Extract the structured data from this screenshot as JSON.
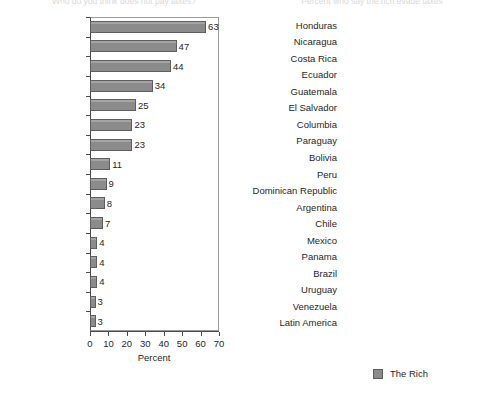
{
  "page": {
    "cut_off_title_left": "Who do you think does not pay taxes?",
    "cut_off_title_right": "Percent who say the rich evade taxes"
  },
  "legend": {
    "label": "The Rich",
    "swatch_color": "#8b8b8b"
  },
  "chart_data": [
    {
      "type": "bar",
      "orientation": "horizontal",
      "title": "",
      "xlabel": "Percent",
      "ylabel": "",
      "xlim": [
        0,
        70
      ],
      "xticks": [
        0,
        10,
        20,
        30,
        40,
        50,
        60,
        70
      ],
      "grid": false,
      "legend_position": "none",
      "series_name": "The Rich",
      "bar_color": "#8b8b8b",
      "categories": [
        "Rich",
        "Politicians",
        "Millionaires",
        "Public officials",
        "Congressmen",
        "Authorities",
        "Companies",
        "The media",
        "Poor",
        "Middle class",
        "Priests",
        "Don't know",
        "Students",
        "Retired",
        "Employees",
        "Women"
      ],
      "values": [
        63,
        47,
        44,
        34,
        25,
        23,
        23,
        11,
        9,
        8,
        7,
        4,
        4,
        4,
        3,
        3
      ]
    },
    {
      "type": "bar",
      "orientation": "horizontal",
      "title": "",
      "xlabel": "Percent",
      "ylabel": "",
      "xlim": [
        0,
        90
      ],
      "xticks": [
        0,
        10,
        20,
        30,
        40,
        50,
        60,
        70,
        80,
        90
      ],
      "grid": false,
      "legend_position": "bottom",
      "series_name": "The Rich",
      "bar_color": "#8b8b8b",
      "categories": [
        "Honduras",
        "Nicaragua",
        "Costa Rica",
        "Ecuador",
        "Guatemala",
        "El Salvador",
        "Columbia",
        "Paraguay",
        "Bolivia",
        "Peru",
        "Dominican Republic",
        "Argentina",
        "Chile",
        "Mexico",
        "Panama",
        "Brazil",
        "Uruguay",
        "Venezuela",
        "Latin America"
      ],
      "values": [
        76,
        73,
        72,
        69,
        67,
        66,
        65,
        64,
        64,
        64,
        63,
        62,
        61,
        61,
        60,
        55,
        54,
        48,
        63
      ]
    }
  ]
}
